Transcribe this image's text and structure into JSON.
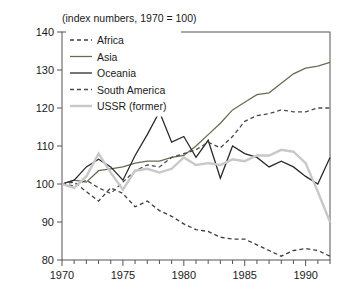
{
  "chart_data": {
    "type": "line",
    "title": "",
    "subtitle": "(index numbers, 1970 = 100)",
    "xlabel": "",
    "ylabel": "",
    "xlim": [
      1970,
      1992
    ],
    "ylim": [
      80,
      140
    ],
    "yticks": [
      80,
      90,
      100,
      110,
      120,
      130,
      140
    ],
    "xticks": [
      1970,
      1975,
      1980,
      1985,
      1990
    ],
    "xtick_labels": [
      "1970",
      "1975",
      "1980",
      "1985",
      "1990"
    ],
    "x_minor_step": 1,
    "grid": false,
    "legend_position": "top-left",
    "x": [
      1970,
      1971,
      1972,
      1973,
      1974,
      1975,
      1976,
      1977,
      1978,
      1979,
      1980,
      1981,
      1982,
      1983,
      1984,
      1985,
      1986,
      1987,
      1988,
      1989,
      1990,
      1991,
      1992
    ],
    "series": [
      {
        "name": "Africa",
        "color": "#3d3d3d",
        "style": "dashed",
        "width": 1.3,
        "values": [
          100,
          100.5,
          98,
          95.5,
          99,
          97.5,
          94,
          95.5,
          93,
          91.5,
          89.5,
          88,
          87.5,
          86,
          85.5,
          85.5,
          84,
          82.5,
          81,
          82.5,
          83,
          82.5,
          81
        ]
      },
      {
        "name": "Asia",
        "color": "#6b6b52",
        "style": "solid",
        "width": 1.3,
        "values": [
          100,
          101,
          100.5,
          103.5,
          104,
          104.5,
          105.5,
          106,
          106,
          107,
          107.5,
          110,
          113,
          116,
          119.5,
          121.5,
          123.5,
          124,
          126.5,
          129,
          130.5,
          131,
          132
        ]
      },
      {
        "name": "Oceania",
        "color": "#2b2b2b",
        "style": "solid",
        "width": 1.3,
        "values": [
          100,
          101,
          104.5,
          106.5,
          104.5,
          101,
          107.5,
          113,
          119,
          111,
          112.5,
          107,
          111.5,
          101.5,
          110,
          108,
          107,
          104.5,
          106,
          104.5,
          102,
          100,
          107
        ]
      },
      {
        "name": "South America",
        "color": "#4a4a4a",
        "style": "dashed",
        "width": 1.3,
        "values": [
          100,
          99.5,
          101,
          99,
          97.5,
          100.5,
          103.5,
          105,
          104.5,
          107,
          108,
          109,
          111,
          109.5,
          112.5,
          116.5,
          118,
          118.5,
          119.5,
          119,
          119,
          120,
          120
        ]
      },
      {
        "name": "USSR (former)",
        "color": "#c8c8c8",
        "style": "solid",
        "width": 2.4,
        "values": [
          100,
          99,
          102,
          108,
          103,
          98.5,
          103.5,
          104,
          103,
          104,
          107,
          105,
          105.5,
          105,
          106.5,
          106,
          107.5,
          107.5,
          109,
          108.5,
          105.5,
          98,
          90
        ]
      }
    ]
  },
  "legend": {
    "items": [
      {
        "label": "Africa"
      },
      {
        "label": "Asia"
      },
      {
        "label": "Oceania"
      },
      {
        "label": "South America"
      },
      {
        "label": "USSR (former)"
      }
    ]
  }
}
